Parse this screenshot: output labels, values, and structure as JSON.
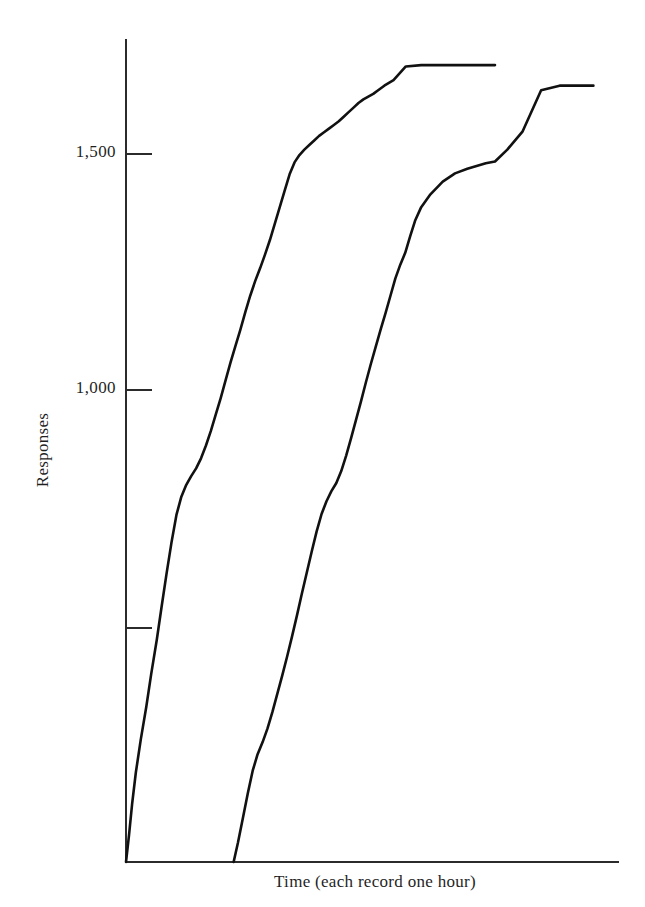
{
  "chart_data": {
    "type": "line",
    "title": "",
    "subtitle": "",
    "xlabel": "Time (each record one hour)",
    "ylabel": "Responses",
    "grid": false,
    "legend": null,
    "xlim": [
      0,
      8
    ],
    "ylim": [
      0,
      1800
    ],
    "y_ticks": [
      500,
      1000,
      1500
    ],
    "y_tick_labels": [
      "",
      "1,000",
      "1,500"
    ],
    "x_ticks": [],
    "x_tick_labels": [],
    "annotations": [],
    "series": [
      {
        "name": "record-1",
        "final_value": 1745,
        "x": [
          0.0,
          0.05,
          0.1,
          0.16,
          0.24,
          0.33,
          0.41,
          0.5,
          0.58,
          0.66,
          0.74,
          0.82,
          0.9,
          0.98,
          1.06,
          1.14,
          1.22,
          1.3,
          1.38,
          1.46,
          1.54,
          1.62,
          1.7,
          1.78,
          1.86,
          1.94,
          2.02,
          2.1,
          2.18,
          2.26,
          2.34,
          2.42,
          2.5,
          2.58,
          2.66,
          2.74,
          2.82,
          2.9,
          2.98,
          3.06,
          3.14,
          3.22,
          3.3,
          3.38,
          3.46,
          3.54,
          3.62,
          3.7,
          3.78,
          3.86,
          3.94,
          4.02,
          4.1,
          4.2,
          4.35,
          4.55,
          4.8,
          5.05,
          5.3,
          5.55,
          5.8,
          6.0
        ],
        "values": [
          0,
          60,
          128,
          196,
          268,
          340,
          412,
          486,
          560,
          632,
          700,
          760,
          800,
          826,
          845,
          862,
          884,
          912,
          944,
          980,
          1016,
          1055,
          1094,
          1130,
          1166,
          1204,
          1240,
          1272,
          1300,
          1330,
          1362,
          1398,
          1434,
          1470,
          1506,
          1532,
          1548,
          1560,
          1570,
          1580,
          1590,
          1598,
          1606,
          1614,
          1622,
          1632,
          1642,
          1652,
          1662,
          1670,
          1676,
          1682,
          1690,
          1700,
          1712,
          1742,
          1745,
          1745,
          1745,
          1745,
          1745,
          1745
        ]
      },
      {
        "name": "record-2",
        "final_value": 1700,
        "x": [
          1.75,
          1.82,
          1.9,
          1.98,
          2.06,
          2.14,
          2.22,
          2.3,
          2.38,
          2.46,
          2.54,
          2.62,
          2.7,
          2.78,
          2.86,
          2.94,
          3.02,
          3.1,
          3.18,
          3.26,
          3.34,
          3.42,
          3.5,
          3.58,
          3.66,
          3.74,
          3.82,
          3.9,
          3.98,
          4.06,
          4.14,
          4.22,
          4.3,
          4.38,
          4.46,
          4.54,
          4.62,
          4.7,
          4.8,
          4.95,
          5.15,
          5.35,
          5.55,
          5.7,
          5.85,
          6.0,
          6.2,
          6.45,
          6.75,
          7.05,
          7.35,
          7.6
        ],
        "values": [
          0,
          42,
          96,
          150,
          200,
          236,
          262,
          292,
          328,
          368,
          408,
          450,
          494,
          540,
          588,
          634,
          680,
          724,
          762,
          790,
          812,
          830,
          856,
          890,
          928,
          968,
          1008,
          1050,
          1090,
          1128,
          1166,
          1202,
          1240,
          1278,
          1308,
          1334,
          1370,
          1404,
          1434,
          1462,
          1490,
          1508,
          1518,
          1524,
          1530,
          1534,
          1560,
          1600,
          1690,
          1700,
          1700,
          1700
        ]
      }
    ]
  },
  "axes": {
    "y_axis_title": "Responses",
    "x_axis_title": "Time (each record one hour)",
    "tick_1500_label": "1,500",
    "tick_1000_label": "1,000"
  }
}
